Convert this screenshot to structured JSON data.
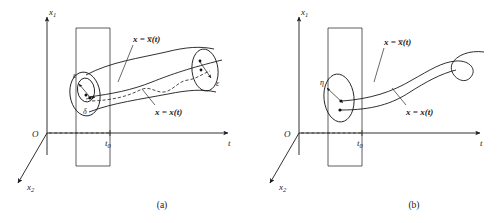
{
  "figure": {
    "panels": [
      {
        "id": "panel-a",
        "caption": "(a)",
        "axes": {
          "vertical_label": "x",
          "vertical_sub": "1",
          "depth_label": "x",
          "depth_sub": "2",
          "horizontal_label": "t",
          "origin_label": "O",
          "initial_time_label": "t",
          "initial_time_sub": "0"
        },
        "labels": {
          "perturbed_curve": "x = x̅(t)",
          "perturbed_curve_lhs": "x",
          "perturbed_curve_eq": "=",
          "perturbed_curve_rhs": "x̅(t)",
          "nominal_curve": "x = x(t)",
          "nominal_curve_lhs": "x",
          "nominal_curve_eq": "=",
          "nominal_curve_rhs": "x(t)",
          "epsilon_left": "ε",
          "delta_left": "δ",
          "epsilon_right": "ε"
        }
      },
      {
        "id": "panel-b",
        "caption": "(b)",
        "axes": {
          "vertical_label": "x",
          "vertical_sub": "1",
          "depth_label": "x",
          "depth_sub": "2",
          "horizontal_label": "t",
          "origin_label": "O",
          "initial_time_label": "t",
          "initial_time_sub": "0"
        },
        "labels": {
          "perturbed_curve": "x = x̅(t)",
          "perturbed_curve_lhs": "x",
          "perturbed_curve_eq": "=",
          "perturbed_curve_rhs": "x̅(t)",
          "nominal_curve": "x = x(t)",
          "nominal_curve_lhs": "x",
          "nominal_curve_eq": "=",
          "nominal_curve_rhs": "x(t)",
          "eta_label": "η"
        }
      }
    ],
    "colors": {
      "ink": "#1a1a1a",
      "background": "#ffffff"
    }
  }
}
